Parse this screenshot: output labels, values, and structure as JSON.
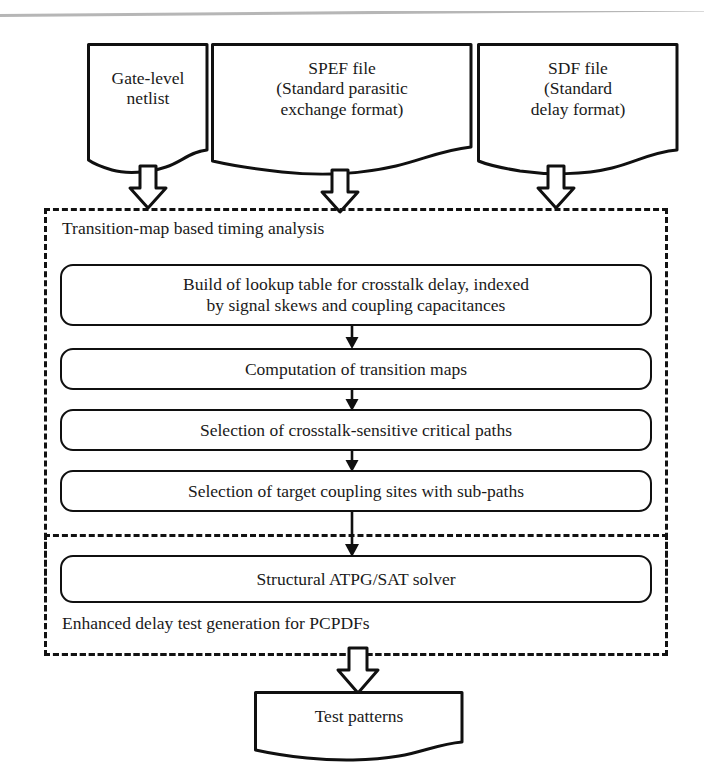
{
  "figure": {
    "type": "flowchart",
    "colors": {
      "stroke": "#101010",
      "fill": "#ffffff",
      "text": "#1a1a1a",
      "scan_rule": "#a9a9a9"
    }
  },
  "inputs": [
    {
      "id": "gate-level-netlist",
      "shape": "document",
      "text": "Gate-level\nnetlist"
    },
    {
      "id": "spef-file",
      "shape": "document",
      "text": "SPEF file\n(Standard parasitic\nexchange format)"
    },
    {
      "id": "sdf-file",
      "shape": "document",
      "text": "SDF file\n(Standard\ndelay format)"
    }
  ],
  "groups": {
    "timing_analysis": {
      "id": "transition-map-timing-analysis",
      "label": "Transition-map based timing analysis",
      "border": "dashed"
    },
    "test_generation": {
      "id": "enhanced-delay-test-generation",
      "label": "Enhanced delay test generation for PCPDFs",
      "border": "dashed"
    }
  },
  "steps": [
    {
      "id": "build-lookup-table",
      "shape": "rounded-rect",
      "text": "Build of lookup table for crosstalk delay, indexed\nby signal skews and coupling capacitances"
    },
    {
      "id": "computation-of-transition-maps",
      "shape": "rounded-rect",
      "text": "Computation of transition maps"
    },
    {
      "id": "selection-of-critical-paths",
      "shape": "rounded-rect",
      "text": "Selection of crosstalk-sensitive critical paths"
    },
    {
      "id": "selection-of-coupling-sites",
      "shape": "rounded-rect",
      "text": "Selection of target coupling sites with sub-paths"
    },
    {
      "id": "structural-atpg-sat-solver",
      "shape": "rounded-rect",
      "text": "Structural ATPG/SAT solver"
    }
  ],
  "output": {
    "id": "test-patterns",
    "shape": "document",
    "text": "Test patterns"
  },
  "connectors": [
    {
      "id": "netlist-to-analysis",
      "style": "block-arrow",
      "direction": "down"
    },
    {
      "id": "spef-to-analysis",
      "style": "block-arrow",
      "direction": "down"
    },
    {
      "id": "sdf-to-analysis",
      "style": "block-arrow",
      "direction": "down"
    },
    {
      "id": "lookup-to-transition-maps",
      "style": "line-arrow",
      "direction": "down"
    },
    {
      "id": "transition-maps-to-critical-paths",
      "style": "line-arrow",
      "direction": "down"
    },
    {
      "id": "critical-paths-to-coupling-sites",
      "style": "line-arrow",
      "direction": "down"
    },
    {
      "id": "coupling-sites-to-atpg",
      "style": "line-arrow",
      "direction": "down"
    },
    {
      "id": "atpg-to-test-patterns",
      "style": "block-arrow",
      "direction": "down"
    }
  ]
}
